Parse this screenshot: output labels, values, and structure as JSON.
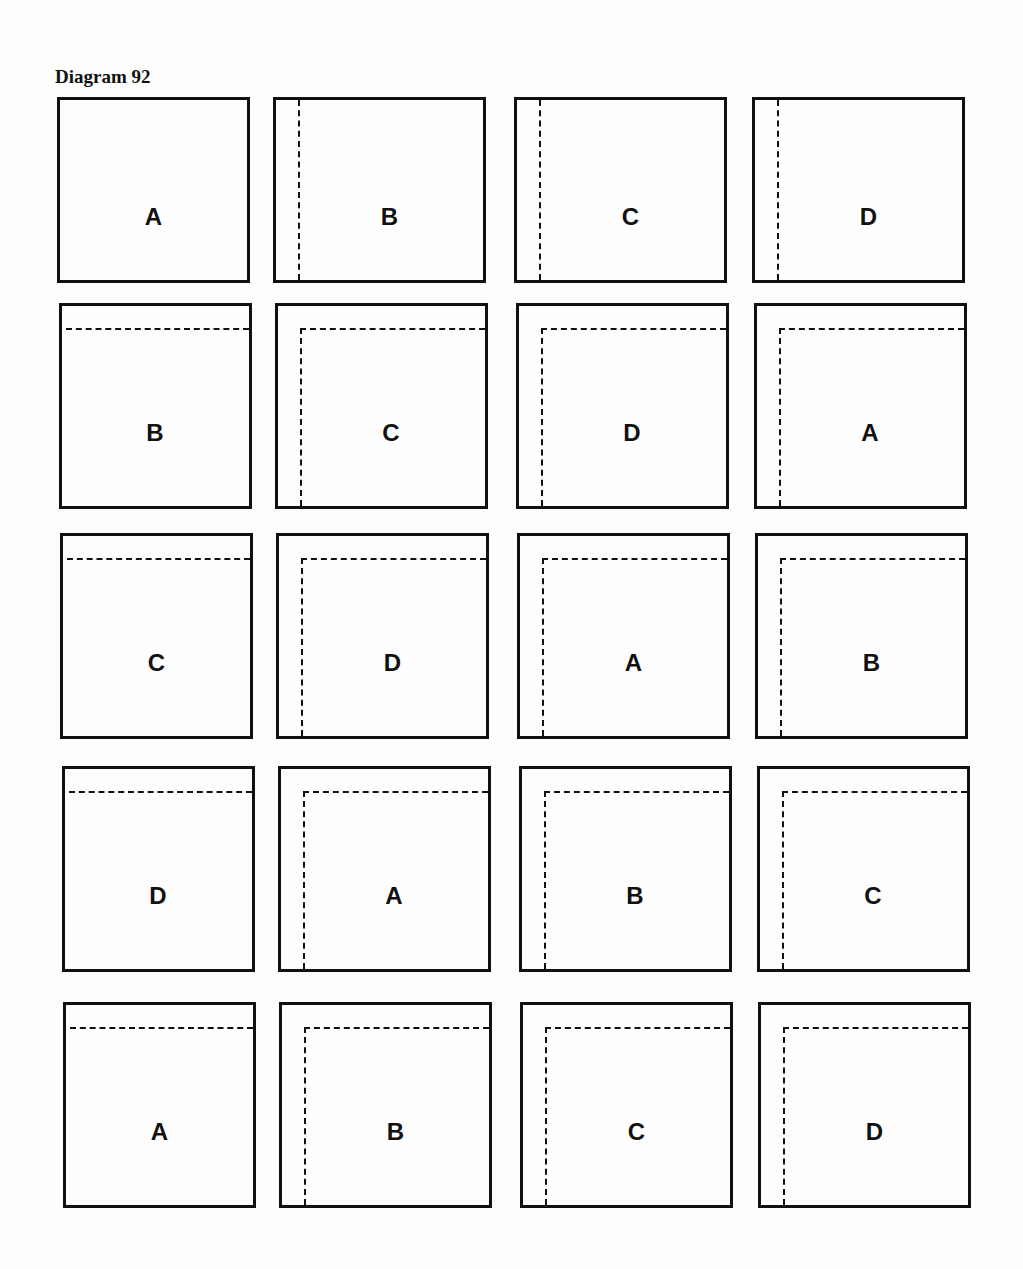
{
  "title": "Diagram 92",
  "grid": {
    "rows": [
      {
        "squares": [
          {
            "label": "A",
            "fold": "none"
          },
          {
            "label": "B",
            "fold": "vertical"
          },
          {
            "label": "C",
            "fold": "vertical"
          },
          {
            "label": "D",
            "fold": "vertical"
          }
        ]
      },
      {
        "squares": [
          {
            "label": "B",
            "fold": "horizontal"
          },
          {
            "label": "C",
            "fold": "corner"
          },
          {
            "label": "D",
            "fold": "corner"
          },
          {
            "label": "A",
            "fold": "corner"
          }
        ]
      },
      {
        "squares": [
          {
            "label": "C",
            "fold": "horizontal"
          },
          {
            "label": "D",
            "fold": "corner"
          },
          {
            "label": "A",
            "fold": "corner"
          },
          {
            "label": "B",
            "fold": "corner"
          }
        ]
      },
      {
        "squares": [
          {
            "label": "D",
            "fold": "horizontal"
          },
          {
            "label": "A",
            "fold": "corner"
          },
          {
            "label": "B",
            "fold": "corner"
          },
          {
            "label": "C",
            "fold": "corner"
          }
        ]
      },
      {
        "squares": [
          {
            "label": "A",
            "fold": "horizontal"
          },
          {
            "label": "B",
            "fold": "corner"
          },
          {
            "label": "C",
            "fold": "corner"
          },
          {
            "label": "D",
            "fold": "corner"
          }
        ]
      }
    ]
  }
}
